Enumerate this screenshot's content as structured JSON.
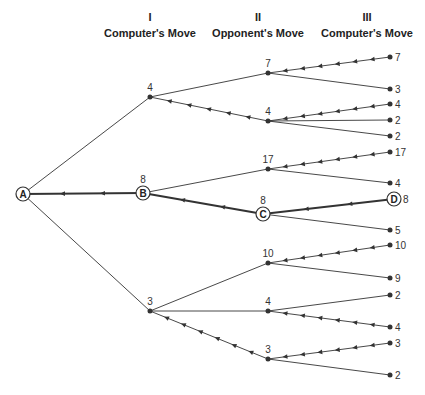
{
  "headers": [
    {
      "numeral": "I",
      "label": "Computer's Move",
      "x": 150
    },
    {
      "numeral": "II",
      "label": "Opponent's Move",
      "x": 258
    },
    {
      "numeral": "III",
      "label": "Computer's Move",
      "x": 367
    }
  ],
  "root": {
    "label": "A",
    "x": 23,
    "y": 194
  },
  "nodes": [
    {
      "id": "n1",
      "x": 150,
      "y": 97,
      "value": "4",
      "parent": "root",
      "arrows": false
    },
    {
      "id": "B",
      "x": 143,
      "y": 193,
      "value": "8",
      "label": "B",
      "parent": "root",
      "arrows": true,
      "bold": true
    },
    {
      "id": "n3",
      "x": 150,
      "y": 311,
      "value": "3",
      "parent": "root",
      "arrows": false
    },
    {
      "id": "n11",
      "x": 268,
      "y": 73,
      "value": "7",
      "parent": "n1",
      "arrows": false
    },
    {
      "id": "n12",
      "x": 268,
      "y": 121,
      "value": "4",
      "parent": "n1",
      "arrows": true
    },
    {
      "id": "n21",
      "x": 268,
      "y": 169,
      "value": "17",
      "parent": "B",
      "arrows": false
    },
    {
      "id": "C",
      "x": 263,
      "y": 214,
      "value": "8",
      "label": "C",
      "parent": "B",
      "arrows": true,
      "bold": true
    },
    {
      "id": "n31",
      "x": 268,
      "y": 263,
      "value": "10",
      "parent": "n3",
      "arrows": false
    },
    {
      "id": "n32",
      "x": 268,
      "y": 311,
      "value": "4",
      "parent": "n3",
      "arrows": false
    },
    {
      "id": "n33",
      "x": 268,
      "y": 359,
      "value": "3",
      "parent": "n3",
      "arrows": true
    }
  ],
  "leaves": [
    {
      "x": 390,
      "y": 57,
      "value": "7",
      "parent": "n11",
      "arrows": true
    },
    {
      "x": 390,
      "y": 89,
      "value": "3",
      "parent": "n11",
      "arrows": false
    },
    {
      "x": 390,
      "y": 104,
      "value": "4",
      "parent": "n12",
      "arrows": true
    },
    {
      "x": 390,
      "y": 120,
      "value": "2",
      "parent": "n12",
      "arrows": false
    },
    {
      "x": 390,
      "y": 136,
      "value": "2",
      "parent": "n12",
      "arrows": false
    },
    {
      "x": 390,
      "y": 152,
      "value": "17",
      "parent": "n21",
      "arrows": true
    },
    {
      "x": 390,
      "y": 183,
      "value": "4",
      "parent": "n21",
      "arrows": false
    },
    {
      "x": 394,
      "y": 199,
      "value": "8",
      "label": "D",
      "parent": "C",
      "arrows": true,
      "bold": true
    },
    {
      "x": 390,
      "y": 230,
      "value": "5",
      "parent": "C",
      "arrows": false
    },
    {
      "x": 390,
      "y": 245,
      "value": "10",
      "parent": "n31",
      "arrows": true
    },
    {
      "x": 390,
      "y": 278,
      "value": "9",
      "parent": "n31",
      "arrows": false
    },
    {
      "x": 390,
      "y": 295,
      "value": "2",
      "parent": "n32",
      "arrows": false
    },
    {
      "x": 390,
      "y": 327,
      "value": "4",
      "parent": "n32",
      "arrows": true
    },
    {
      "x": 390,
      "y": 343,
      "value": "3",
      "parent": "n33",
      "arrows": true
    },
    {
      "x": 390,
      "y": 375,
      "value": "2",
      "parent": "n33",
      "arrows": false
    }
  ],
  "colors": {
    "line": "#333333",
    "text": "#222222",
    "background": "#ffffff"
  }
}
